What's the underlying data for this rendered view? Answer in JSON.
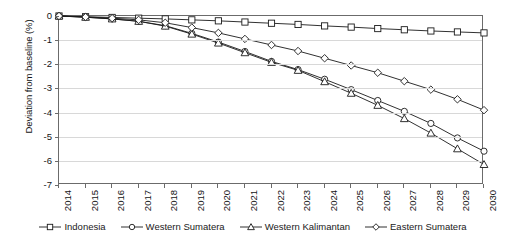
{
  "chart_data": {
    "type": "line",
    "title": "",
    "xlabel": "",
    "ylabel": "Deviation from baseline (%)",
    "x": [
      2014,
      2015,
      2016,
      2017,
      2018,
      2019,
      2020,
      2021,
      2022,
      2023,
      2024,
      2025,
      2026,
      2027,
      2028,
      2029,
      2030
    ],
    "categories": [
      "2014",
      "2015",
      "2016",
      "2017",
      "2018",
      "2019",
      "2020",
      "2021",
      "2022",
      "2023",
      "2024",
      "2025",
      "2026",
      "2027",
      "2028",
      "2029",
      "2030"
    ],
    "xlim": [
      2014,
      2030
    ],
    "ylim": [
      -7,
      0
    ],
    "yticks": [
      0,
      -1,
      -2,
      -3,
      -4,
      -5,
      -6,
      -7
    ],
    "ytick_labels": [
      "0",
      "-1",
      "-2",
      "-3",
      "-4",
      "-5",
      "-6",
      "-7"
    ],
    "grid": true,
    "legend_position": "bottom",
    "series": [
      {
        "name": "Indonesia",
        "marker": "square",
        "color": "#1a1a1a",
        "values": [
          0.0,
          -0.03,
          -0.06,
          -0.09,
          -0.12,
          -0.16,
          -0.2,
          -0.25,
          -0.3,
          -0.35,
          -0.41,
          -0.46,
          -0.52,
          -0.57,
          -0.62,
          -0.66,
          -0.7
        ]
      },
      {
        "name": "Western Sumatera",
        "marker": "circle",
        "color": "#1a1a1a",
        "values": [
          0.0,
          -0.05,
          -0.12,
          -0.22,
          -0.4,
          -0.72,
          -1.08,
          -1.47,
          -1.88,
          -2.22,
          -2.62,
          -3.05,
          -3.5,
          -3.95,
          -4.45,
          -5.05,
          -5.6
        ]
      },
      {
        "name": "Western Kalimantan",
        "marker": "triangle",
        "color": "#1a1a1a",
        "values": [
          0.0,
          -0.05,
          -0.12,
          -0.22,
          -0.42,
          -0.75,
          -1.12,
          -1.52,
          -1.92,
          -2.25,
          -2.72,
          -3.2,
          -3.7,
          -4.25,
          -4.85,
          -5.5,
          -6.15
        ]
      },
      {
        "name": "Eastern Sumatera",
        "marker": "diamond",
        "color": "#1a1a1a",
        "values": [
          0.0,
          -0.04,
          -0.09,
          -0.16,
          -0.28,
          -0.48,
          -0.7,
          -0.95,
          -1.2,
          -1.45,
          -1.75,
          -2.05,
          -2.35,
          -2.7,
          -3.05,
          -3.45,
          -3.9
        ]
      }
    ]
  }
}
